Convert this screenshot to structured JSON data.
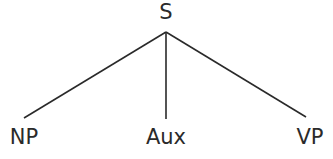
{
  "diagram": {
    "type": "syntax-tree",
    "root": {
      "label": "S",
      "x": 166,
      "y": 2
    },
    "apex": {
      "x": 166,
      "y": 32
    },
    "children": [
      {
        "label": "NP",
        "x": 24,
        "y": 127,
        "line_end": {
          "x": 24,
          "y": 118
        }
      },
      {
        "label": "Aux",
        "x": 166,
        "y": 127,
        "line_end": {
          "x": 166,
          "y": 119
        }
      },
      {
        "label": "VP",
        "x": 310,
        "y": 127,
        "line_end": {
          "x": 306,
          "y": 117
        }
      }
    ],
    "line_color": "#2a2a2a",
    "text_color": "#2a2a2a"
  }
}
